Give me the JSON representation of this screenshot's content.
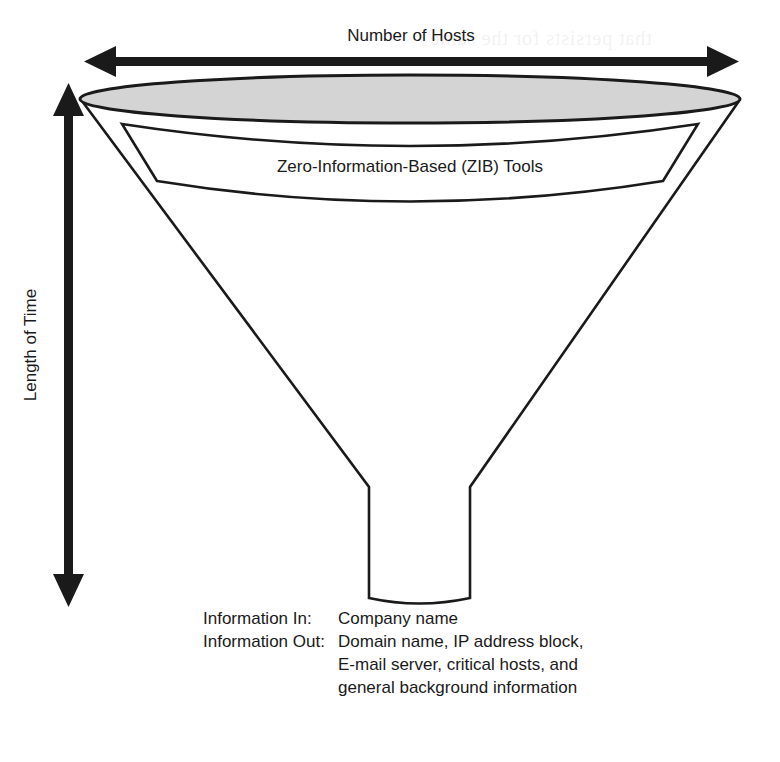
{
  "figure": {
    "title_axis_x": "Number of Hosts",
    "title_axis_y": "Length of Time",
    "band_label": "Zero-Information-Based (ZIB) Tools",
    "shape_name": "funnel",
    "fill_color_ellipse": "#d4d4d4",
    "stroke_color": "#1a1a1a",
    "background_color": "#ffffff"
  },
  "legend": {
    "rows": [
      {
        "key": "Information In:",
        "value": "Company name"
      },
      {
        "key": "Information Out:",
        "value": "Domain name, IP address block,"
      }
    ],
    "continuation": [
      "E-mail server, critical hosts, and",
      "general background information"
    ]
  },
  "bleed_through": [
    "that persists for the same",
    "sources will serve the",
    "that cannot enumerate"
  ]
}
